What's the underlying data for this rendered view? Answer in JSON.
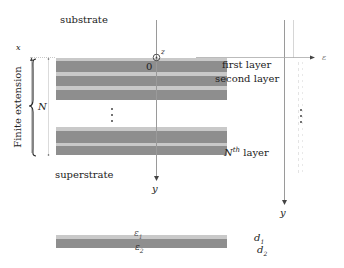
{
  "labels": {
    "substrate": "substrate",
    "superstrate": "superstrate",
    "first_layer": "first layer",
    "second_layer": "second layer",
    "nth_layer_prefix": "N",
    "nth_layer_sup": "th",
    "nth_layer_suffix": "layer",
    "finite_extension": "Finite extension",
    "N": "N",
    "origin": "0",
    "axis_x": "x",
    "axis_y": "y",
    "axis_z": "z",
    "axis_eps": "ε",
    "eps1": "ε",
    "eps1_sub": "1",
    "eps2": "ε",
    "eps2_sub": "2",
    "d1": "d",
    "d1_sub": "1",
    "d2": "d",
    "d2_sub": "2",
    "vdots": "⋮"
  },
  "colors": {
    "light_layer": "#c9c9c9",
    "dark_layer": "#8e8e8e",
    "axis": "#9a9a9a"
  }
}
